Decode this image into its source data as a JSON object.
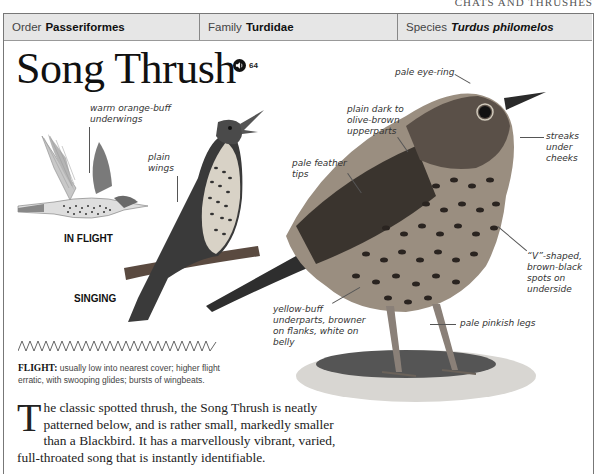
{
  "section_title": "CHATS AND THRUSHES",
  "taxonomy": {
    "order": {
      "label": "Order",
      "value": "Passeriformes"
    },
    "family": {
      "label": "Family",
      "value": "Turdidae"
    },
    "species": {
      "label": "Species",
      "value": "Turdus philomelos"
    }
  },
  "title": "Song Thrush",
  "audio": {
    "icon": "speaker-icon",
    "track": "64"
  },
  "captions": {
    "in_flight": "IN FLIGHT",
    "singing": "SINGING"
  },
  "annotations": {
    "underwings": "warm orange-buff underwings",
    "plain_wings": "plain wings",
    "eye_ring": "pale eye-ring",
    "upperparts": "plain dark to olive-brown upperparts",
    "feather_tips": "pale feather tips",
    "cheeks": "streaks under cheeks",
    "spots": "“V”-shaped, brown-black spots on underside",
    "underparts": "yellow-buff underparts, browner on flanks, white on belly",
    "legs": "pale pinkish legs"
  },
  "flight": {
    "label": "FLIGHT:",
    "text": "usually low into nearest cover; higher flight erratic, with swooping glides; bursts of wingbeats."
  },
  "description": {
    "dropcap": "T",
    "text": "he classic spotted thrush, the Song Thrush is neatly patterned below, and is rather small, markedly smaller than a Blackbird. It has a marvellously vibrant, varied, full-throated song that is instantly identifiable."
  }
}
